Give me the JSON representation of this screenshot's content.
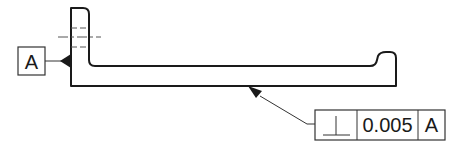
{
  "drawing": {
    "type": "GD&T perpendicularity callout",
    "datum_feature": {
      "letter": "A"
    },
    "feature_control_frame": {
      "symbol": "⊥",
      "symbol_name": "perpendicularity",
      "tolerance": "0.005",
      "datum_reference": "A"
    },
    "colors": {
      "line": "#1a1a1a",
      "background": "#ffffff"
    }
  }
}
